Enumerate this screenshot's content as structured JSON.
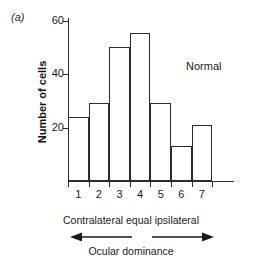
{
  "panel": {
    "label": "(a)"
  },
  "annotation": {
    "condition": "Normal"
  },
  "captions": {
    "dominance_scale": "Contralateral equal ipsilateral",
    "axis_caption": "Ocular dominance",
    "left_arrow_icon": "arrow-left-icon",
    "right_arrow_icon": "arrow-right-icon"
  },
  "chart_data": {
    "type": "bar",
    "title": "",
    "subtitle": "",
    "xlabel": "Ocular dominance",
    "ylabel": "Number of cells",
    "categories": [
      "1",
      "2",
      "3",
      "4",
      "5",
      "6",
      "7"
    ],
    "values": [
      24,
      29,
      50,
      55,
      29,
      13,
      21
    ],
    "series": [
      {
        "name": "Normal",
        "values": [
          24,
          29,
          50,
          55,
          29,
          13,
          21
        ]
      }
    ],
    "ylim": [
      0,
      60
    ],
    "yticks": [
      20,
      40,
      60
    ],
    "ytick_labels": [
      "20",
      "40",
      "60"
    ],
    "xtick_labels": [
      "1",
      "2",
      "3",
      "4",
      "5",
      "6",
      "7"
    ],
    "grid": false,
    "legend": "none",
    "bar_fill": "#ffffff",
    "bar_edge": "#2b2b2b",
    "axis_color": "#2b2b2b",
    "background": "#ffffff"
  }
}
